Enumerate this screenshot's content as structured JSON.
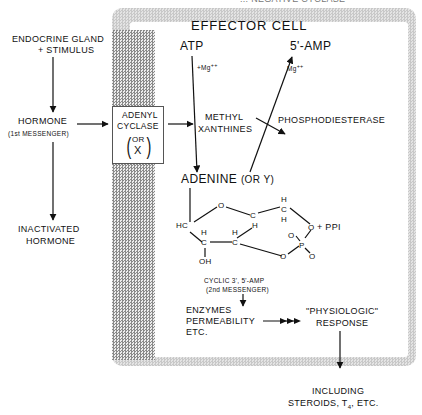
{
  "header": {
    "partial_caption": "... NEGATIVE CYCLASE"
  },
  "left_column": {
    "source_line1": "ENDOCRINE GLAND",
    "source_line2": "+ STIMULUS",
    "hormone": "HORMONE",
    "hormone_sub": "(1st MESSENGER)",
    "inactivated_line1": "INACTIVATED",
    "inactivated_line2": "HORMONE"
  },
  "membrane": {
    "cyclase_line1": "ADENYL",
    "cyclase_line2": "CYCLASE",
    "cyclase_or": "OR",
    "cyclase_x": "X"
  },
  "effector_cell": {
    "title": "EFFECTOR CELL",
    "atp": "ATP",
    "mg_atp": "+Mg",
    "mg_atp_sup": "++",
    "amp5": "5'-AMP",
    "mg_amp": "Mg",
    "mg_amp_sup": "++",
    "methyl_line1": "METHYL",
    "methyl_line2": "XANTHINES",
    "phosphodiesterase": "PHOSPHODIESTERASE",
    "adenine": "ADENINE",
    "adenine_or": "(OR  Y)",
    "ppi": "+ PPI",
    "cyclic_line1": "CYCLIC 3', 5'-AMP",
    "cyclic_line2": "(2nd MESSENGER)",
    "enzymes_line1": "ENZYMES",
    "enzymes_line2": "PERMEABILITY",
    "enzymes_line3": "ETC.",
    "response_line1": "\"PHYSIOLOGIC\"",
    "response_line2": "RESPONSE",
    "structure": {
      "o_ring": "O",
      "c_h1": "C",
      "h1": "H",
      "hc": "HC",
      "h_top1": "H",
      "c_top": "C",
      "h_top2": "H",
      "o_right": "O",
      "h_a": "H",
      "c_a": "C",
      "h_b": "H",
      "c_b": "C",
      "oh": "OH",
      "o_p1": "O",
      "p": "P",
      "o_p2": "O",
      "o_p3": "O"
    }
  },
  "footer": {
    "line1": "INCLUDING",
    "line2": "STEROIDS, T",
    "sub": "4",
    "line2_end": ", ETC."
  }
}
